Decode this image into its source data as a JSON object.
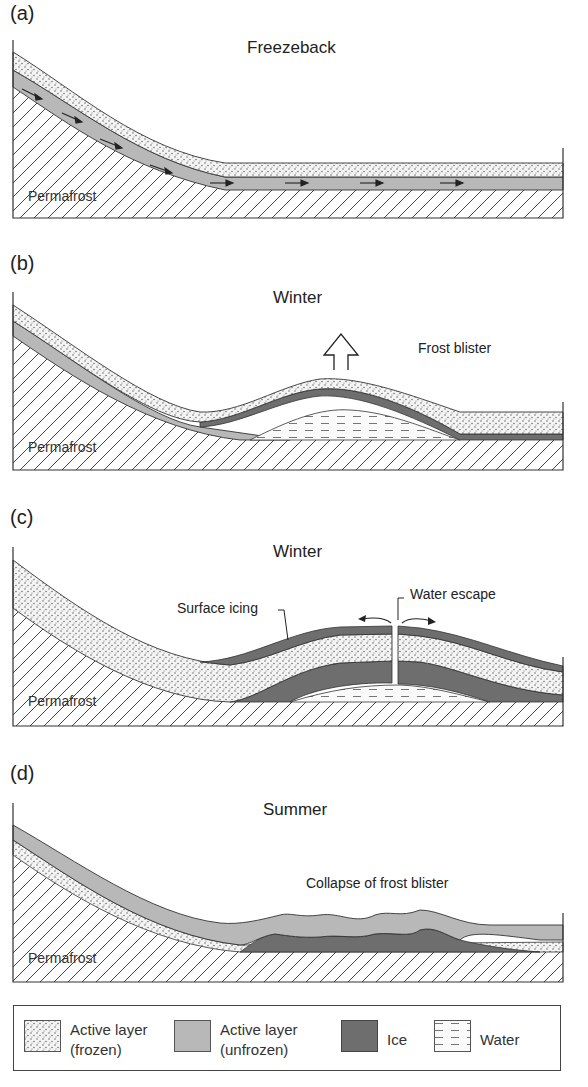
{
  "panels": [
    {
      "label": "(a)",
      "title": "Freezeback",
      "permafrost": "Permafrost",
      "annotations": []
    },
    {
      "label": "(b)",
      "title": "Winter",
      "permafrost": "Permafrost",
      "annotations": [
        "Frost blister"
      ]
    },
    {
      "label": "(c)",
      "title": "Winter",
      "permafrost": "Permafrost",
      "annotations": [
        "Surface icing",
        "Water escape"
      ]
    },
    {
      "label": "(d)",
      "title": "Summer",
      "permafrost": "Permafrost",
      "annotations": [
        "Collapse of frost blister"
      ]
    }
  ],
  "legend": {
    "items": [
      {
        "line1": "Active layer",
        "line2": "(frozen)",
        "pattern": "stipple"
      },
      {
        "line1": "Active layer",
        "line2": "(unfrozen)",
        "pattern": "light-gray",
        "color": "#b8b8b8"
      },
      {
        "line1": "Ice",
        "line2": "",
        "pattern": "dark-gray",
        "color": "#6e6e6e"
      },
      {
        "line1": "Water",
        "line2": "",
        "pattern": "dashes"
      }
    ]
  },
  "colors": {
    "unfrozen": "#b8b8b8",
    "ice": "#6e6e6e",
    "outline": "#333333"
  }
}
